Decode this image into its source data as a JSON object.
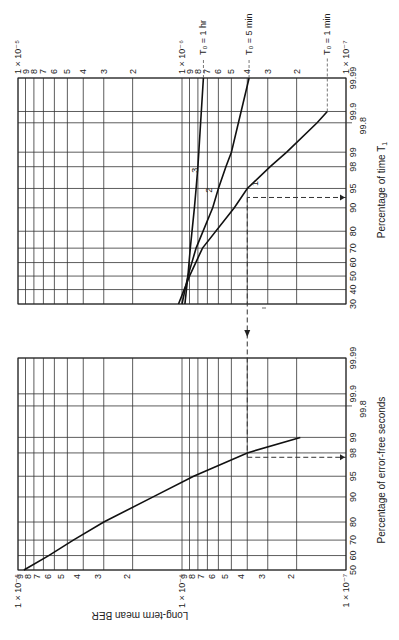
{
  "chart_data": [
    {
      "type": "line",
      "panel": "upper",
      "title": "",
      "xlabel": "Percentage of time T1",
      "ylabel": "Long-term mean BER",
      "x_scale": "probability",
      "y_scale": "log",
      "x_ticks": [
        "30",
        "40",
        "50",
        "60",
        "70",
        "80",
        "90",
        "95",
        "98",
        "99",
        "99.8",
        "99.9",
        "99.99"
      ],
      "y_ticks": [
        "1 × 10^-5",
        "9",
        "8",
        "7",
        "6",
        "5",
        "4",
        "3",
        "2",
        "1 × 10^-6",
        "9",
        "8",
        "7",
        "6",
        "5",
        "4",
        "3",
        "2",
        "1 × 10^-7"
      ],
      "ylim": [
        1e-07,
        1e-05
      ],
      "xlim": [
        30,
        99.99
      ],
      "series": [
        {
          "name": "1",
          "label": "T0 = 1 min",
          "x": [
            30,
            50,
            70,
            90,
            95,
            98,
            99,
            99.8,
            99.9
          ],
          "y": [
            1.05e-06,
            9e-07,
            7.5e-07,
            4.8e-07,
            4e-07,
            2.9e-07,
            2.3e-07,
            1.5e-07,
            1.3e-07
          ]
        },
        {
          "name": "2",
          "label": "T0 = 5 min",
          "x": [
            30,
            50,
            70,
            90,
            95,
            98,
            99,
            99.99
          ],
          "y": [
            1e-06,
            9.2e-07,
            8.2e-07,
            6.5e-07,
            6e-07,
            5.4e-07,
            5e-07,
            3.9e-07
          ]
        },
        {
          "name": "3",
          "label": "T0 = 1 hr",
          "x": [
            30,
            50,
            70,
            90,
            95,
            98,
            99,
            99.99
          ],
          "y": [
            9.6e-07,
            9.2e-07,
            8.9e-07,
            8.4e-07,
            8.2e-07,
            8e-07,
            7.9e-07,
            7.4e-07
          ]
        }
      ],
      "annotations": [
        "T0 = 1 hr",
        "T0 = 5 min",
        "T0 = 1 min",
        "dashed arrow from 93% of time T1 at curve 1 (BER ≈ 4 × 10^-7)"
      ]
    },
    {
      "type": "line",
      "panel": "lower",
      "title": "",
      "xlabel": "Percentage of error-free seconds",
      "ylabel": "Long-term mean BER",
      "x_scale": "probability",
      "y_scale": "log",
      "x_ticks": [
        "50",
        "60",
        "70",
        "80",
        "90",
        "95",
        "98",
        "99",
        "99.8",
        "99.9",
        "99.99"
      ],
      "y_ticks": [
        "1 × 10^-5",
        "9",
        "8",
        "7",
        "6",
        "5",
        "4",
        "3",
        "2",
        "1 × 10^-6",
        "9",
        "8",
        "7",
        "6",
        "5",
        "4",
        "3",
        "2",
        "1 × 10^-7"
      ],
      "ylim": [
        1e-07,
        1e-05
      ],
      "xlim": [
        50,
        99.99
      ],
      "series": [
        {
          "name": "EFS",
          "x": [
            50,
            60,
            70,
            80,
            90,
            95,
            98,
            99
          ],
          "y": [
            9.2e-06,
            6.5e-06,
            4.6e-06,
            3e-06,
            1.5e-06,
            8.5e-07,
            4e-07,
            1.9e-07
          ]
        }
      ],
      "annotations": [
        "dashed arrow at BER ≈ 4 × 10^-7 meeting curve at ≈ 97.5% error-free seconds"
      ]
    }
  ],
  "labels": {
    "ylabel": "Long-term mean BER",
    "upper_xlabel": "Percentage of time T",
    "upper_xlabel_sub": "1",
    "lower_xlabel": "Percentage of error-free seconds",
    "t0_1hr": "T₀ = 1 hr",
    "t0_5min": "T₀ = 5 min",
    "t0_1min": "T₀ = 1 min",
    "curve1": "1",
    "curve2": "2",
    "curve3": "3",
    "e5": "1 × 10⁻⁵",
    "e6": "1 × 10⁻⁶",
    "e7": "1 × 10⁻⁷"
  }
}
